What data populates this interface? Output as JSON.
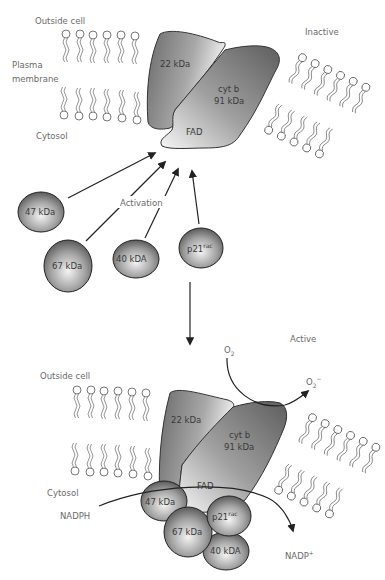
{
  "figure": {
    "top_panel": {
      "state_label": "Inactive",
      "outside_label": "Outside cell",
      "membrane_label_line1": "Plasma",
      "membrane_label_line2": "membrane",
      "cytosol_label": "Cytosol",
      "activation_label": "Activation",
      "subunits": {
        "p22": "22 kDa",
        "cytb_line1": "cyt b",
        "cytb_line2": "91 kDa",
        "fad": "FAD"
      },
      "cytosolic_factors": [
        {
          "id": "p47",
          "label": "47 kDa"
        },
        {
          "id": "p67",
          "label": "67 kDa"
        },
        {
          "id": "p40",
          "label": "40 kDA"
        },
        {
          "id": "p21",
          "label": "p21",
          "sup": "rac"
        }
      ]
    },
    "bottom_panel": {
      "state_label": "Active",
      "outside_label": "Outside cell",
      "cytosol_label": "Cytosol",
      "subunits": {
        "p22": "22 kDa",
        "cytb_line1": "cyt b",
        "cytb_line2": "91 kDa",
        "fad": "FAD"
      },
      "bound_factors": [
        {
          "id": "p47",
          "label": "47 kDa"
        },
        {
          "id": "p67",
          "label": "67 kDa"
        },
        {
          "id": "p21",
          "label": "p21",
          "sup": "rac"
        },
        {
          "id": "p40",
          "label": "40 kDA"
        }
      ],
      "substrate_in": "O",
      "substrate_in_sub": "2",
      "product_out": "O",
      "product_out_sub": "2",
      "product_out_sup": "−",
      "electron_donor": "NADPH",
      "electron_donor_product": "NADP",
      "electron_donor_product_sup": "+"
    },
    "colors": {
      "protein_dark": "#6e6e6e",
      "protein_light": "#f2f2f2",
      "text": "#6a6a6a",
      "arrow": "#222222"
    }
  }
}
